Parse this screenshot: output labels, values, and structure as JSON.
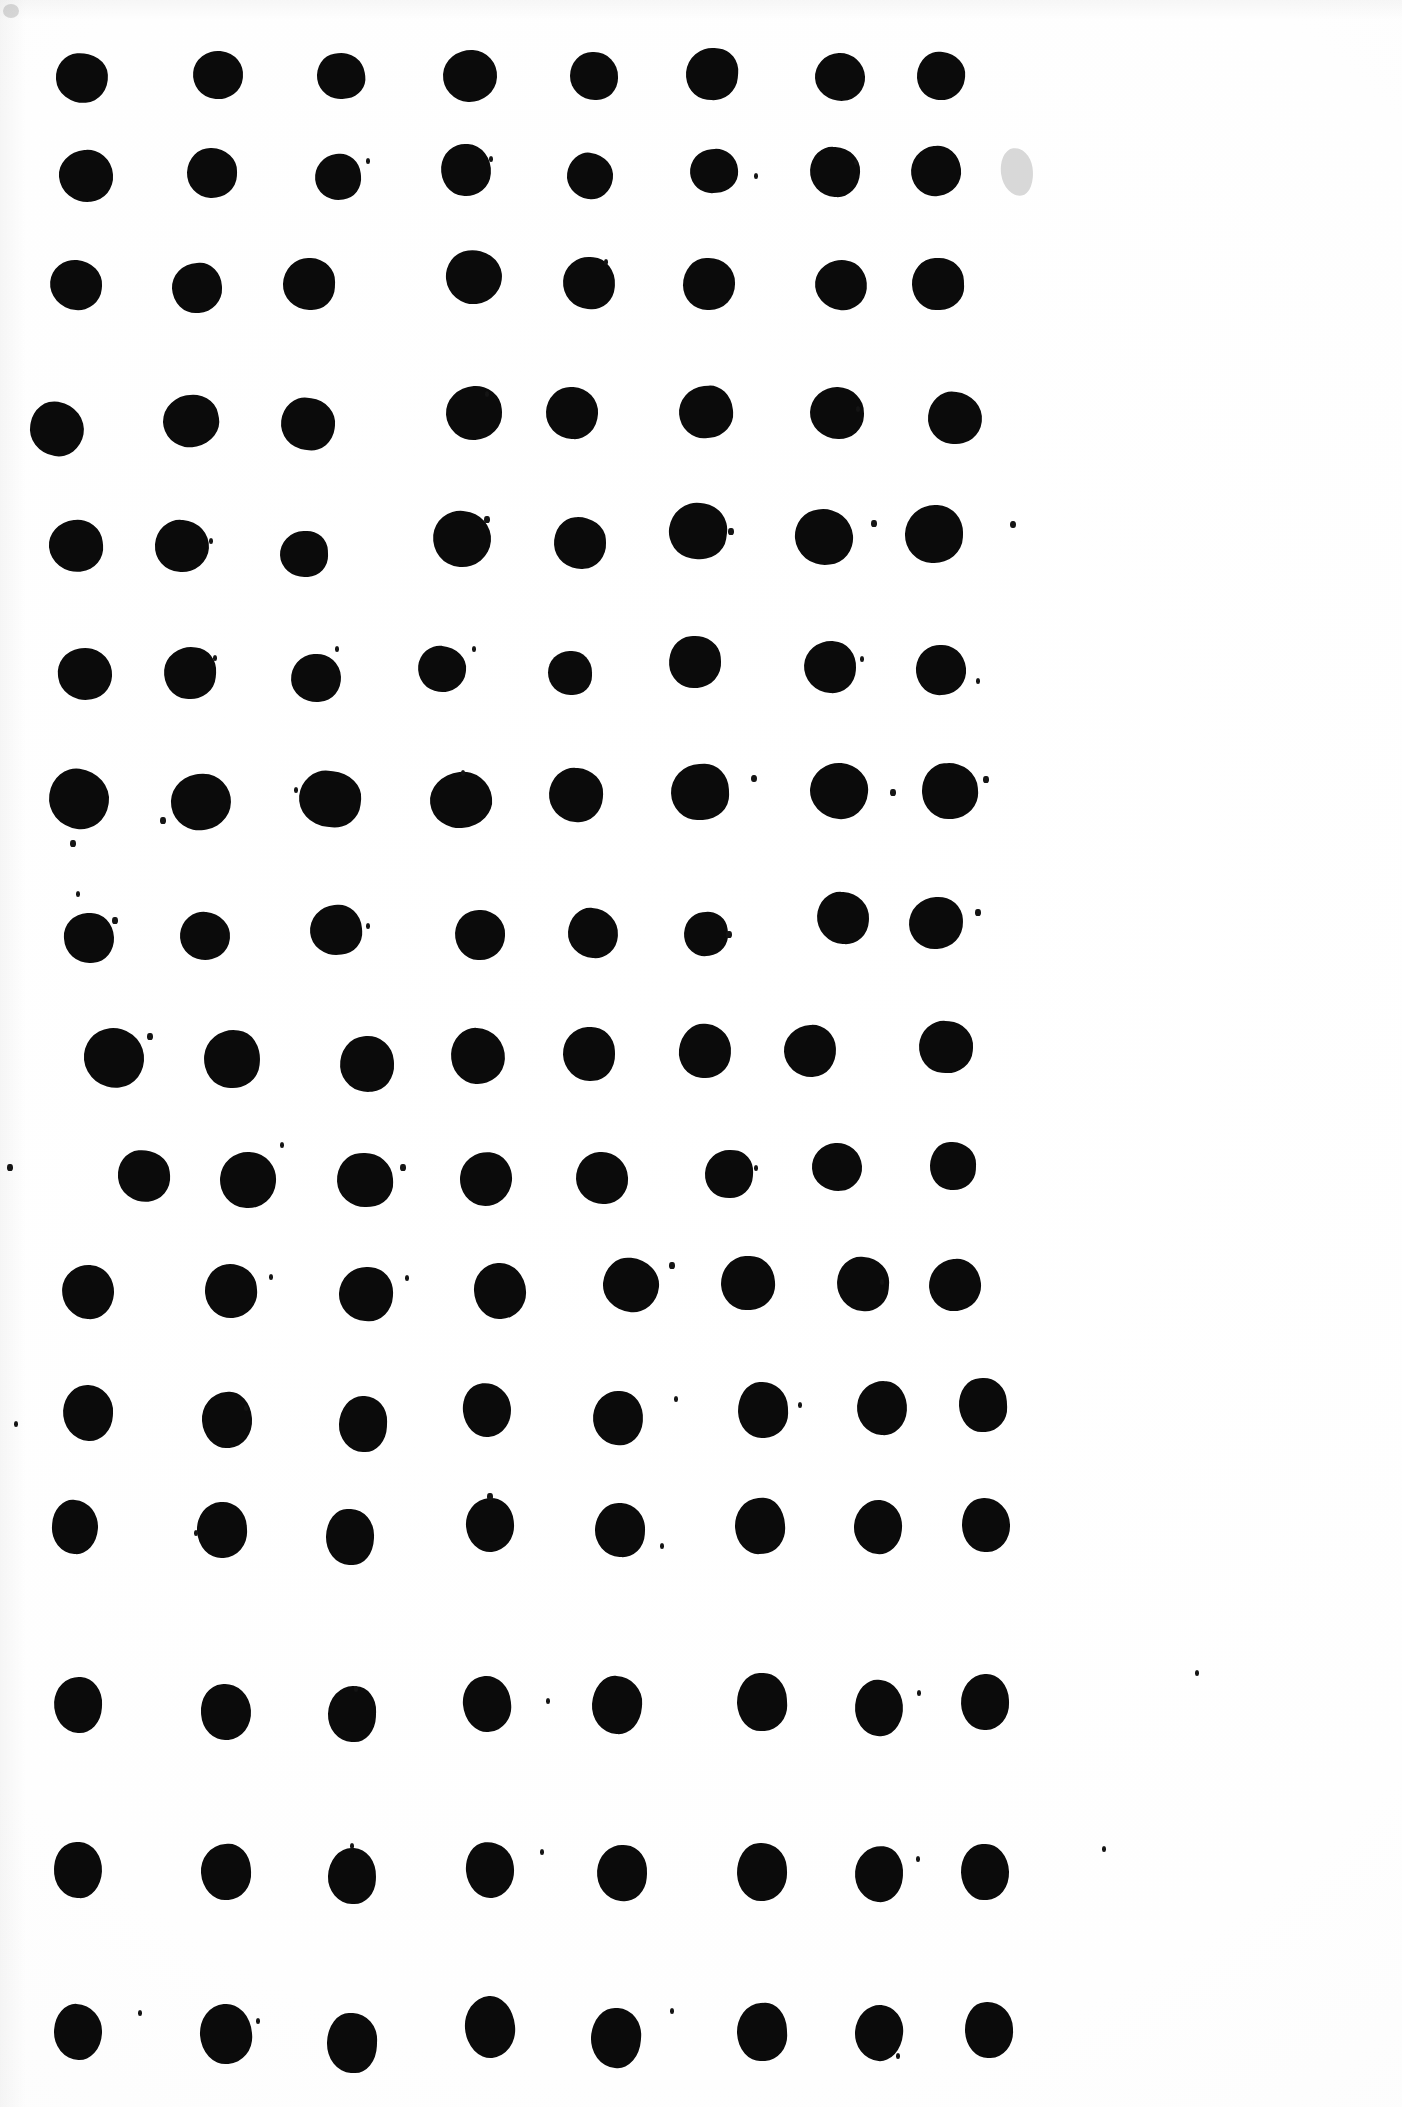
{
  "page": {
    "background_color": "#ffffff",
    "ink_color": "#0b0b0b",
    "smudge_color": "#d8d8d8",
    "width": 1402,
    "height": 2107,
    "rows": 13,
    "columns": 8
  },
  "chart_data": {
    "type": "scatter",
    "xlabel": "",
    "ylabel": "",
    "xlim": [
      0,
      1402
    ],
    "ylim": [
      0,
      2107
    ],
    "grid": false,
    "legend": "none",
    "marker_color": "#0b0b0b",
    "row_count": 13,
    "column_count": 8,
    "row_y": [
      78,
      175,
      283,
      425,
      542,
      672,
      797,
      932,
      1058,
      1180,
      1292,
      1413,
      1527
    ],
    "column_x": [
      82,
      215,
      345,
      473,
      594,
      712,
      840,
      940
    ],
    "dots": [
      {
        "cx": 82,
        "cy": 78,
        "rx": 26,
        "ry": 25,
        "rot": -4
      },
      {
        "cx": 218,
        "cy": 75,
        "rx": 25,
        "ry": 24,
        "rot": 6
      },
      {
        "cx": 341,
        "cy": 76,
        "rx": 24,
        "ry": 23,
        "rot": -8
      },
      {
        "cx": 470,
        "cy": 76,
        "rx": 27,
        "ry": 26,
        "rot": 3
      },
      {
        "cx": 594,
        "cy": 76,
        "rx": 24,
        "ry": 24,
        "rot": 0
      },
      {
        "cx": 712,
        "cy": 74,
        "rx": 26,
        "ry": 26,
        "rot": 5
      },
      {
        "cx": 840,
        "cy": 77,
        "rx": 25,
        "ry": 24,
        "rot": -3
      },
      {
        "cx": 941,
        "cy": 76,
        "rx": 24,
        "ry": 24,
        "rot": 7
      },
      {
        "cx": 86,
        "cy": 176,
        "rx": 27,
        "ry": 26,
        "rot": -5
      },
      {
        "cx": 212,
        "cy": 173,
        "rx": 25,
        "ry": 25,
        "rot": 2
      },
      {
        "cx": 338,
        "cy": 177,
        "rx": 23,
        "ry": 23,
        "rot": -6
      },
      {
        "cx": 466,
        "cy": 170,
        "rx": 25,
        "ry": 26,
        "rot": 4
      },
      {
        "cx": 590,
        "cy": 176,
        "rx": 23,
        "ry": 23,
        "rot": 8
      },
      {
        "cx": 714,
        "cy": 171,
        "rx": 24,
        "ry": 22,
        "rot": -4
      },
      {
        "cx": 835,
        "cy": 172,
        "rx": 25,
        "ry": 25,
        "rot": 3
      },
      {
        "cx": 936,
        "cy": 171,
        "rx": 25,
        "ry": 25,
        "rot": -7
      },
      {
        "cx": 76,
        "cy": 285,
        "rx": 26,
        "ry": 25,
        "rot": 5
      },
      {
        "cx": 197,
        "cy": 288,
        "rx": 25,
        "ry": 25,
        "rot": -3
      },
      {
        "cx": 309,
        "cy": 284,
        "rx": 26,
        "ry": 26,
        "rot": 2
      },
      {
        "cx": 474,
        "cy": 277,
        "rx": 28,
        "ry": 27,
        "rot": -6
      },
      {
        "cx": 589,
        "cy": 283,
        "rx": 26,
        "ry": 26,
        "rot": 4
      },
      {
        "cx": 709,
        "cy": 284,
        "rx": 26,
        "ry": 26,
        "rot": 0
      },
      {
        "cx": 841,
        "cy": 285,
        "rx": 26,
        "ry": 25,
        "rot": 6
      },
      {
        "cx": 938,
        "cy": 284,
        "rx": 26,
        "ry": 26,
        "rot": -2
      },
      {
        "cx": 57,
        "cy": 429,
        "rx": 27,
        "ry": 27,
        "rot": 10
      },
      {
        "cx": 191,
        "cy": 421,
        "rx": 28,
        "ry": 26,
        "rot": -12
      },
      {
        "cx": 308,
        "cy": 424,
        "rx": 27,
        "ry": 26,
        "rot": 7
      },
      {
        "cx": 474,
        "cy": 413,
        "rx": 28,
        "ry": 27,
        "rot": -4
      },
      {
        "cx": 572,
        "cy": 413,
        "rx": 26,
        "ry": 26,
        "rot": 3
      },
      {
        "cx": 706,
        "cy": 412,
        "rx": 27,
        "ry": 26,
        "rot": -5
      },
      {
        "cx": 837,
        "cy": 413,
        "rx": 27,
        "ry": 26,
        "rot": 2
      },
      {
        "cx": 955,
        "cy": 418,
        "rx": 27,
        "ry": 26,
        "rot": 6
      },
      {
        "cx": 76,
        "cy": 546,
        "rx": 27,
        "ry": 26,
        "rot": -6
      },
      {
        "cx": 182,
        "cy": 546,
        "rx": 27,
        "ry": 26,
        "rot": 4
      },
      {
        "cx": 304,
        "cy": 554,
        "rx": 24,
        "ry": 23,
        "rot": -2
      },
      {
        "cx": 462,
        "cy": 539,
        "rx": 29,
        "ry": 28,
        "rot": 5
      },
      {
        "cx": 580,
        "cy": 543,
        "rx": 26,
        "ry": 26,
        "rot": -3
      },
      {
        "cx": 698,
        "cy": 531,
        "rx": 29,
        "ry": 28,
        "rot": 8
      },
      {
        "cx": 824,
        "cy": 537,
        "rx": 29,
        "ry": 28,
        "rot": -5
      },
      {
        "cx": 934,
        "cy": 534,
        "rx": 29,
        "ry": 29,
        "rot": 2
      },
      {
        "cx": 85,
        "cy": 674,
        "rx": 27,
        "ry": 26,
        "rot": -8
      },
      {
        "cx": 190,
        "cy": 673,
        "rx": 26,
        "ry": 26,
        "rot": 5
      },
      {
        "cx": 316,
        "cy": 678,
        "rx": 25,
        "ry": 24,
        "rot": -3
      },
      {
        "cx": 442,
        "cy": 669,
        "rx": 24,
        "ry": 23,
        "rot": 6
      },
      {
        "cx": 570,
        "cy": 673,
        "rx": 22,
        "ry": 22,
        "rot": 0
      },
      {
        "cx": 695,
        "cy": 662,
        "rx": 26,
        "ry": 26,
        "rot": -4
      },
      {
        "cx": 830,
        "cy": 667,
        "rx": 26,
        "ry": 26,
        "rot": 3
      },
      {
        "cx": 941,
        "cy": 670,
        "rx": 25,
        "ry": 25,
        "rot": -6
      },
      {
        "cx": 79,
        "cy": 799,
        "rx": 30,
        "ry": 30,
        "rot": 8
      },
      {
        "cx": 201,
        "cy": 802,
        "rx": 30,
        "ry": 28,
        "rot": -10
      },
      {
        "cx": 330,
        "cy": 799,
        "rx": 31,
        "ry": 28,
        "rot": 6
      },
      {
        "cx": 461,
        "cy": 800,
        "rx": 31,
        "ry": 28,
        "rot": -7
      },
      {
        "cx": 576,
        "cy": 795,
        "rx": 27,
        "ry": 27,
        "rot": 4
      },
      {
        "cx": 700,
        "cy": 792,
        "rx": 29,
        "ry": 28,
        "rot": -2
      },
      {
        "cx": 839,
        "cy": 791,
        "rx": 29,
        "ry": 28,
        "rot": 5
      },
      {
        "cx": 950,
        "cy": 791,
        "rx": 28,
        "ry": 28,
        "rot": -4
      },
      {
        "cx": 89,
        "cy": 938,
        "rx": 25,
        "ry": 25,
        "rot": -3
      },
      {
        "cx": 205,
        "cy": 936,
        "rx": 25,
        "ry": 24,
        "rot": 6
      },
      {
        "cx": 336,
        "cy": 930,
        "rx": 26,
        "ry": 25,
        "rot": -5
      },
      {
        "cx": 480,
        "cy": 935,
        "rx": 25,
        "ry": 25,
        "rot": 2
      },
      {
        "cx": 593,
        "cy": 933,
        "rx": 25,
        "ry": 25,
        "rot": 4
      },
      {
        "cx": 706,
        "cy": 934,
        "rx": 22,
        "ry": 22,
        "rot": -6
      },
      {
        "cx": 843,
        "cy": 918,
        "rx": 26,
        "ry": 26,
        "rot": 3
      },
      {
        "cx": 936,
        "cy": 923,
        "rx": 27,
        "ry": 26,
        "rot": -2
      },
      {
        "cx": 114,
        "cy": 1058,
        "rx": 30,
        "ry": 30,
        "rot": -6
      },
      {
        "cx": 232,
        "cy": 1059,
        "rx": 28,
        "ry": 29,
        "rot": 5
      },
      {
        "cx": 367,
        "cy": 1064,
        "rx": 27,
        "ry": 28,
        "rot": -4
      },
      {
        "cx": 478,
        "cy": 1056,
        "rx": 27,
        "ry": 28,
        "rot": 3
      },
      {
        "cx": 589,
        "cy": 1054,
        "rx": 26,
        "ry": 27,
        "rot": -2
      },
      {
        "cx": 705,
        "cy": 1051,
        "rx": 26,
        "ry": 27,
        "rot": 6
      },
      {
        "cx": 810,
        "cy": 1051,
        "rx": 26,
        "ry": 26,
        "rot": -3
      },
      {
        "cx": 946,
        "cy": 1047,
        "rx": 27,
        "ry": 26,
        "rot": 4
      },
      {
        "cx": 144,
        "cy": 1176,
        "rx": 26,
        "ry": 26,
        "rot": -5
      },
      {
        "cx": 248,
        "cy": 1180,
        "rx": 28,
        "ry": 28,
        "rot": 4
      },
      {
        "cx": 365,
        "cy": 1180,
        "rx": 28,
        "ry": 27,
        "rot": -3
      },
      {
        "cx": 486,
        "cy": 1179,
        "rx": 26,
        "ry": 27,
        "rot": 5
      },
      {
        "cx": 602,
        "cy": 1178,
        "rx": 26,
        "ry": 26,
        "rot": -2
      },
      {
        "cx": 729,
        "cy": 1174,
        "rx": 24,
        "ry": 24,
        "rot": 3
      },
      {
        "cx": 837,
        "cy": 1167,
        "rx": 25,
        "ry": 24,
        "rot": -4
      },
      {
        "cx": 953,
        "cy": 1166,
        "rx": 23,
        "ry": 24,
        "rot": 2
      },
      {
        "cx": 88,
        "cy": 1292,
        "rx": 26,
        "ry": 27,
        "rot": 4
      },
      {
        "cx": 231,
        "cy": 1291,
        "rx": 26,
        "ry": 27,
        "rot": -5
      },
      {
        "cx": 366,
        "cy": 1294,
        "rx": 27,
        "ry": 27,
        "rot": 3
      },
      {
        "cx": 500,
        "cy": 1291,
        "rx": 26,
        "ry": 28,
        "rot": -2
      },
      {
        "cx": 631,
        "cy": 1285,
        "rx": 28,
        "ry": 27,
        "rot": 6
      },
      {
        "cx": 748,
        "cy": 1283,
        "rx": 27,
        "ry": 27,
        "rot": -3
      },
      {
        "cx": 863,
        "cy": 1284,
        "rx": 26,
        "ry": 27,
        "rot": 4
      },
      {
        "cx": 955,
        "cy": 1285,
        "rx": 26,
        "ry": 26,
        "rot": -5
      },
      {
        "cx": 88,
        "cy": 1413,
        "rx": 25,
        "ry": 28,
        "rot": 3
      },
      {
        "cx": 227,
        "cy": 1420,
        "rx": 25,
        "ry": 28,
        "rot": -4
      },
      {
        "cx": 363,
        "cy": 1424,
        "rx": 24,
        "ry": 28,
        "rot": 2
      },
      {
        "cx": 487,
        "cy": 1410,
        "rx": 24,
        "ry": 27,
        "rot": -6
      },
      {
        "cx": 618,
        "cy": 1418,
        "rx": 25,
        "ry": 27,
        "rot": 5
      },
      {
        "cx": 763,
        "cy": 1410,
        "rx": 25,
        "ry": 28,
        "rot": -2
      },
      {
        "cx": 882,
        "cy": 1408,
        "rx": 25,
        "ry": 27,
        "rot": 4
      },
      {
        "cx": 983,
        "cy": 1405,
        "rx": 24,
        "ry": 27,
        "rot": -3
      },
      {
        "cx": 75,
        "cy": 1527,
        "rx": 23,
        "ry": 27,
        "rot": 4
      },
      {
        "cx": 222,
        "cy": 1530,
        "rx": 25,
        "ry": 28,
        "rot": -3
      },
      {
        "cx": 350,
        "cy": 1537,
        "rx": 24,
        "ry": 28,
        "rot": 2
      },
      {
        "cx": 490,
        "cy": 1525,
        "rx": 24,
        "ry": 27,
        "rot": -5
      },
      {
        "cx": 620,
        "cy": 1530,
        "rx": 25,
        "ry": 27,
        "rot": 3
      },
      {
        "cx": 760,
        "cy": 1526,
        "rx": 25,
        "ry": 28,
        "rot": -4
      },
      {
        "cx": 878,
        "cy": 1527,
        "rx": 24,
        "ry": 27,
        "rot": 5
      },
      {
        "cx": 986,
        "cy": 1525,
        "rx": 24,
        "ry": 27,
        "rot": -2
      },
      {
        "cx": 78,
        "cy": 1705,
        "rx": 24,
        "ry": 28,
        "rot": 3
      },
      {
        "cx": 226,
        "cy": 1712,
        "rx": 25,
        "ry": 28,
        "rot": -4
      },
      {
        "cx": 352,
        "cy": 1714,
        "rx": 24,
        "ry": 28,
        "rot": 2
      },
      {
        "cx": 487,
        "cy": 1704,
        "rx": 24,
        "ry": 28,
        "rot": -5
      },
      {
        "cx": 617,
        "cy": 1705,
        "rx": 25,
        "ry": 29,
        "rot": 4
      },
      {
        "cx": 762,
        "cy": 1702,
        "rx": 25,
        "ry": 29,
        "rot": -3
      },
      {
        "cx": 879,
        "cy": 1708,
        "rx": 24,
        "ry": 28,
        "rot": 5
      },
      {
        "cx": 985,
        "cy": 1702,
        "rx": 24,
        "ry": 28,
        "rot": -2
      },
      {
        "cx": 78,
        "cy": 1870,
        "rx": 24,
        "ry": 28,
        "rot": 3
      },
      {
        "cx": 226,
        "cy": 1872,
        "rx": 25,
        "ry": 28,
        "rot": -4
      },
      {
        "cx": 352,
        "cy": 1876,
        "rx": 24,
        "ry": 28,
        "rot": 2
      },
      {
        "cx": 490,
        "cy": 1870,
        "rx": 24,
        "ry": 28,
        "rot": -5
      },
      {
        "cx": 622,
        "cy": 1873,
        "rx": 25,
        "ry": 28,
        "rot": 4
      },
      {
        "cx": 762,
        "cy": 1872,
        "rx": 25,
        "ry": 29,
        "rot": -3
      },
      {
        "cx": 879,
        "cy": 1874,
        "rx": 24,
        "ry": 28,
        "rot": 5
      },
      {
        "cx": 985,
        "cy": 1872,
        "rx": 24,
        "ry": 28,
        "rot": -2
      },
      {
        "cx": 78,
        "cy": 2032,
        "rx": 24,
        "ry": 28,
        "rot": 3
      },
      {
        "cx": 226,
        "cy": 2034,
        "rx": 26,
        "ry": 30,
        "rot": -4
      },
      {
        "cx": 352,
        "cy": 2043,
        "rx": 25,
        "ry": 30,
        "rot": 2
      },
      {
        "cx": 490,
        "cy": 2027,
        "rx": 25,
        "ry": 31,
        "rot": -5
      },
      {
        "cx": 616,
        "cy": 2038,
        "rx": 25,
        "ry": 30,
        "rot": 4
      },
      {
        "cx": 762,
        "cy": 2032,
        "rx": 25,
        "ry": 29,
        "rot": -3
      },
      {
        "cx": 879,
        "cy": 2033,
        "rx": 24,
        "ry": 28,
        "rot": 5
      },
      {
        "cx": 989,
        "cy": 2030,
        "rx": 24,
        "ry": 28,
        "rot": -2
      }
    ],
    "specks": [
      {
        "cx": 368,
        "cy": 160,
        "r": 2.2
      },
      {
        "cx": 491,
        "cy": 158,
        "r": 2.4
      },
      {
        "cx": 756,
        "cy": 175,
        "r": 2.4
      },
      {
        "cx": 856,
        "cy": 162,
        "r": 2.0
      },
      {
        "cx": 606,
        "cy": 261,
        "r": 2.2
      },
      {
        "cx": 487,
        "cy": 393,
        "r": 2.4
      },
      {
        "cx": 858,
        "cy": 408,
        "r": 2.2
      },
      {
        "cx": 211,
        "cy": 540,
        "r": 2.4
      },
      {
        "cx": 487,
        "cy": 519,
        "r": 2.6
      },
      {
        "cx": 731,
        "cy": 531,
        "r": 2.6
      },
      {
        "cx": 874,
        "cy": 523,
        "r": 2.6
      },
      {
        "cx": 1013,
        "cy": 524,
        "r": 2.8
      },
      {
        "cx": 215,
        "cy": 657,
        "r": 2.4
      },
      {
        "cx": 337,
        "cy": 648,
        "r": 2.2
      },
      {
        "cx": 474,
        "cy": 648,
        "r": 2.4
      },
      {
        "cx": 862,
        "cy": 658,
        "r": 2.4
      },
      {
        "cx": 978,
        "cy": 680,
        "r": 2.2
      },
      {
        "cx": 163,
        "cy": 820,
        "r": 2.6
      },
      {
        "cx": 73,
        "cy": 843,
        "r": 2.6
      },
      {
        "cx": 296,
        "cy": 789,
        "r": 2.4
      },
      {
        "cx": 463,
        "cy": 772,
        "r": 2.4
      },
      {
        "cx": 754,
        "cy": 778,
        "r": 2.8
      },
      {
        "cx": 893,
        "cy": 792,
        "r": 2.6
      },
      {
        "cx": 986,
        "cy": 779,
        "r": 2.6
      },
      {
        "cx": 78,
        "cy": 893,
        "r": 2.2
      },
      {
        "cx": 115,
        "cy": 920,
        "r": 2.6
      },
      {
        "cx": 368,
        "cy": 925,
        "r": 2.4
      },
      {
        "cx": 729,
        "cy": 934,
        "r": 2.6
      },
      {
        "cx": 978,
        "cy": 912,
        "r": 2.6
      },
      {
        "cx": 150,
        "cy": 1036,
        "r": 2.6
      },
      {
        "cx": 282,
        "cy": 1144,
        "r": 2.4
      },
      {
        "cx": 10,
        "cy": 1167,
        "r": 2.6
      },
      {
        "cx": 403,
        "cy": 1167,
        "r": 2.6
      },
      {
        "cx": 756,
        "cy": 1167,
        "r": 2.4
      },
      {
        "cx": 271,
        "cy": 1276,
        "r": 2.4
      },
      {
        "cx": 407,
        "cy": 1277,
        "r": 2.4
      },
      {
        "cx": 672,
        "cy": 1265,
        "r": 2.6
      },
      {
        "cx": 882,
        "cy": 1281,
        "r": 2.2
      },
      {
        "cx": 676,
        "cy": 1398,
        "r": 2.4
      },
      {
        "cx": 800,
        "cy": 1404,
        "r": 2.4
      },
      {
        "cx": 246,
        "cy": 1407,
        "r": 2.2
      },
      {
        "cx": 16,
        "cy": 1423,
        "r": 2.2
      },
      {
        "cx": 196,
        "cy": 1532,
        "r": 2.4
      },
      {
        "cx": 490,
        "cy": 1496,
        "r": 2.6
      },
      {
        "cx": 662,
        "cy": 1545,
        "r": 2.4
      },
      {
        "cx": 356,
        "cy": 1688,
        "r": 2.2
      },
      {
        "cx": 548,
        "cy": 1700,
        "r": 2.4
      },
      {
        "cx": 919,
        "cy": 1692,
        "r": 2.2
      },
      {
        "cx": 1197,
        "cy": 1672,
        "r": 2.2
      },
      {
        "cx": 352,
        "cy": 1845,
        "r": 2.2
      },
      {
        "cx": 542,
        "cy": 1851,
        "r": 2.4
      },
      {
        "cx": 918,
        "cy": 1858,
        "r": 2.2
      },
      {
        "cx": 1104,
        "cy": 1848,
        "r": 2.2
      },
      {
        "cx": 140,
        "cy": 2012,
        "r": 2.2
      },
      {
        "cx": 258,
        "cy": 2020,
        "r": 2.4
      },
      {
        "cx": 672,
        "cy": 2010,
        "r": 2.4
      },
      {
        "cx": 898,
        "cy": 2055,
        "r": 2.2
      }
    ],
    "smudges": [
      {
        "cx": 1017,
        "cy": 172,
        "rx": 16,
        "ry": 24,
        "rot": -8,
        "color": "#d8d8d8"
      }
    ]
  }
}
